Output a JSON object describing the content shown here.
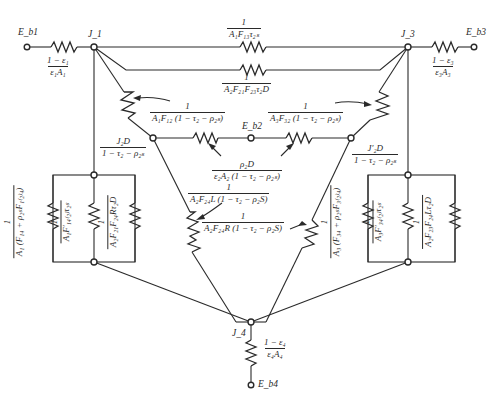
{
  "diagram": {
    "type": "radiation network (electrical analogy)",
    "nodes": {
      "eb1": "E_b1",
      "eb2": "E_b2",
      "eb3": "E_b3",
      "eb4": "E_b4",
      "j1": "J_1",
      "j3": "J_3",
      "j4": "J_4"
    },
    "resistors": {
      "r_surface_1": {
        "num": "1 − ε₁",
        "den": "ε₁A₁"
      },
      "r_surface_3": {
        "num": "1 − ε₃",
        "den": "ε₃A₃"
      },
      "r_surface_4": {
        "num": "1 − ε₄",
        "den": "ε₄A₄"
      },
      "r_13": {
        "num": "1",
        "den": "A₁F₁₃τ₂ₛ"
      },
      "r_123": {
        "num": "1",
        "den": "A₂F₂₁F₂₃τ₂D"
      },
      "r_12": {
        "num": "1",
        "den": "A₁F₁₂ (1 − τ₂ − ρ₂ₛ)"
      },
      "r_32": {
        "num": "1",
        "den": "A₃F₃₂ (1 − τ₂ − ρ₂ₛ)"
      },
      "r_2d_self": {
        "num": "ρ₂D",
        "den": "ε₂A₂ (1 − τ₂ − ρ₂ₛ)"
      },
      "r_24l": {
        "num": "1",
        "den": "A₂F₂₄L (1 − τ₂ − ρ₂S)"
      },
      "r_24r": {
        "num": "1",
        "den": "A₂F₂₄R (1 − τ₂ − ρ₂S)"
      },
      "r_14": {
        "num": "1",
        "den": "A₁ (F₁₄ + ρ₂ₛF₁₍₂₎₄)"
      },
      "r_14_2": {
        "num": "1",
        "den": "A₁F′₁₄₍₂₎τ₂ₛ"
      },
      "r_21_24r": {
        "num": "1",
        "den": "A₂F₂₁F₂₄Rτ₂D"
      },
      "r_34": {
        "num": "1",
        "den": "A₃ (F₃₄ + ρ₂ₛF₃₍₂₎₄)"
      },
      "r_34_2": {
        "num": "1",
        "den": "A₃F′₃₄₍₂₎τ₂ₛ"
      },
      "r_23_24l": {
        "num": "1",
        "den": "A₂F₂₃F₂₄Lτ₂D"
      }
    },
    "sources": {
      "j2d": {
        "num": "J₂D",
        "den": "1 − τ₂ − ρ₂ₛ"
      },
      "j2d_prime": {
        "num": "J′₂D",
        "den": "1 − τ₂ − ρ₂ₛ"
      }
    }
  }
}
